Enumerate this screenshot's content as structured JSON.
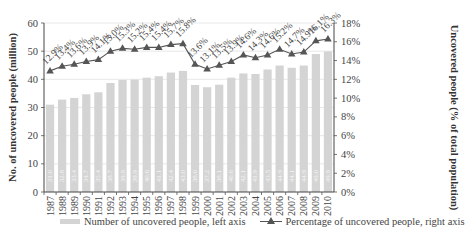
{
  "chart_data": {
    "type": "bar",
    "combo": "bar + line (dual axis)",
    "title": "",
    "categories": [
      "1987",
      "1988",
      "1989",
      "1990",
      "1991",
      "1992",
      "1993",
      "1994",
      "1995",
      "1996",
      "1997",
      "1998",
      "1999",
      "2000",
      "2001",
      "2002",
      "2003",
      "2004",
      "2005",
      "2006",
      "2007",
      "2008",
      "2009",
      "2010"
    ],
    "series": [
      {
        "name": "Number of uncovered people, left axis",
        "type": "bar",
        "axis": "left",
        "color": "#d4d4d4",
        "values": [
          31.0,
          32.8,
          33.4,
          34.7,
          35.4,
          38.7,
          39.8,
          39.9,
          40.6,
          41.1,
          42.4,
          43.0,
          38.0,
          37.2,
          38.1,
          40.6,
          42.1,
          41.9,
          43.5,
          44.9,
          44.1,
          44.9,
          49.0,
          49.9
        ]
      },
      {
        "name": "Percentage of uncovered people, right axis",
        "type": "line",
        "axis": "right",
        "marker": "triangle",
        "color": "#555555",
        "values": [
          12.9,
          13.4,
          13.6,
          13.9,
          14.1,
          15.0,
          15.3,
          15.2,
          15.4,
          15.4,
          15.7,
          15.8,
          13.6,
          13.1,
          13.5,
          13.9,
          14.6,
          14.3,
          14.6,
          15.2,
          14.7,
          14.9,
          16.1,
          16.3
        ],
        "labels": [
          "12.9%",
          "13.4%",
          "13.6%",
          "13.9%",
          "14.1%",
          "15.0%",
          "15.3%",
          "15.2%",
          "15.4%",
          "15.4%",
          "15.7%",
          "15.8%",
          "13.6%",
          "13.1%",
          "13.5%",
          "13.9%",
          "14.6%",
          "14.3%",
          "14.6%",
          "15.2%",
          "14.7%",
          "14.9%",
          "16.1%",
          "16.3%"
        ]
      }
    ],
    "xlabel": "",
    "ylabel": "No. of uncovered people (million)",
    "ylabel_right": "Uncovered people (% of total population)",
    "ylim": [
      0,
      60
    ],
    "ylim_right": [
      0,
      18
    ],
    "yticks": [
      "0",
      "10",
      "20",
      "30",
      "40",
      "50",
      "60"
    ],
    "yticks_right": [
      "0%",
      "2%",
      "4%",
      "6%",
      "8%",
      "10%",
      "12%",
      "14%",
      "16%",
      "18%"
    ],
    "grid": true,
    "legend_position": "bottom"
  },
  "legend": {
    "bar_label": "Number of uncovered people, left axis",
    "line_label": "Percentage of uncovered people, right axis"
  }
}
